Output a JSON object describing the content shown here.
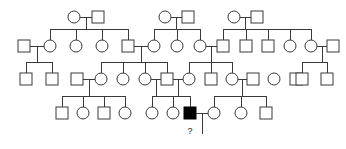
{
  "figure": {
    "background_color": "#ffffff",
    "line_color": "#3a3a3a",
    "unaffected_fill": "#ffffff",
    "affected_fill": "#000000",
    "symbol_size": 12,
    "generations": 4
  },
  "legend": {
    "square_meaning": "male",
    "circle_meaning": "female",
    "filled_meaning": "affected individual",
    "question_mark_meaning": "status unknown"
  },
  "annotations": [
    {
      "id": "unknown-status-marker",
      "text": "?",
      "x": 190,
      "y": 134
    }
  ],
  "chart_data": {
    "type": "diagram",
    "individuals": [
      {
        "id": "I-1",
        "sex": "female",
        "shape": "circle",
        "affected": false,
        "generation": 1,
        "cx": 74,
        "cy": 17
      },
      {
        "id": "I-2",
        "sex": "male",
        "shape": "square",
        "affected": false,
        "generation": 1,
        "cx": 98,
        "cy": 17
      },
      {
        "id": "I-3",
        "sex": "female",
        "shape": "circle",
        "affected": false,
        "generation": 1,
        "cx": 165,
        "cy": 17
      },
      {
        "id": "I-4",
        "sex": "male",
        "shape": "square",
        "affected": false,
        "generation": 1,
        "cx": 188,
        "cy": 17
      },
      {
        "id": "I-5",
        "sex": "female",
        "shape": "circle",
        "affected": false,
        "generation": 1,
        "cx": 234,
        "cy": 17
      },
      {
        "id": "I-6",
        "sex": "male",
        "shape": "square",
        "affected": false,
        "generation": 1,
        "cx": 257,
        "cy": 17
      },
      {
        "id": "II-1",
        "sex": "male",
        "shape": "square",
        "affected": false,
        "generation": 2,
        "cx": 24,
        "cy": 46
      },
      {
        "id": "II-2",
        "sex": "female",
        "shape": "circle",
        "affected": false,
        "generation": 2,
        "cx": 50,
        "cy": 46
      },
      {
        "id": "II-3",
        "sex": "female",
        "shape": "circle",
        "affected": false,
        "generation": 2,
        "cx": 76,
        "cy": 46
      },
      {
        "id": "II-4",
        "sex": "female",
        "shape": "circle",
        "affected": false,
        "generation": 2,
        "cx": 102,
        "cy": 46
      },
      {
        "id": "II-5",
        "sex": "male",
        "shape": "square",
        "affected": false,
        "generation": 2,
        "cx": 128,
        "cy": 46
      },
      {
        "id": "II-6",
        "sex": "female",
        "shape": "circle",
        "affected": false,
        "generation": 2,
        "cx": 154,
        "cy": 46
      },
      {
        "id": "II-7",
        "sex": "female",
        "shape": "circle",
        "affected": false,
        "generation": 2,
        "cx": 177,
        "cy": 46
      },
      {
        "id": "II-8",
        "sex": "female",
        "shape": "circle",
        "affected": false,
        "generation": 2,
        "cx": 200,
        "cy": 46
      },
      {
        "id": "II-9",
        "sex": "male",
        "shape": "square",
        "affected": false,
        "generation": 2,
        "cx": 223,
        "cy": 46
      },
      {
        "id": "II-10",
        "sex": "male",
        "shape": "square",
        "affected": false,
        "generation": 2,
        "cx": 246,
        "cy": 46
      },
      {
        "id": "II-11",
        "sex": "male",
        "shape": "square",
        "affected": false,
        "generation": 2,
        "cx": 268,
        "cy": 46
      },
      {
        "id": "II-12",
        "sex": "female",
        "shape": "circle",
        "affected": false,
        "generation": 2,
        "cx": 290,
        "cy": 46
      },
      {
        "id": "II-13",
        "sex": "female",
        "shape": "circle",
        "affected": false,
        "generation": 2,
        "cx": 311,
        "cy": 46
      },
      {
        "id": "II-14",
        "sex": "male",
        "shape": "square",
        "affected": false,
        "generation": 2,
        "cx": 333,
        "cy": 46
      },
      {
        "id": "III-1",
        "sex": "male",
        "shape": "square",
        "affected": false,
        "generation": 3,
        "cx": 26,
        "cy": 79
      },
      {
        "id": "III-2",
        "sex": "male",
        "shape": "square",
        "affected": false,
        "generation": 3,
        "cx": 52,
        "cy": 79
      },
      {
        "id": "III-3",
        "sex": "male",
        "shape": "square",
        "affected": false,
        "generation": 3,
        "cx": 77,
        "cy": 79
      },
      {
        "id": "III-4",
        "sex": "female",
        "shape": "circle",
        "affected": false,
        "generation": 3,
        "cx": 101,
        "cy": 79
      },
      {
        "id": "III-5",
        "sex": "female",
        "shape": "circle",
        "affected": false,
        "generation": 3,
        "cx": 123,
        "cy": 79
      },
      {
        "id": "III-6",
        "sex": "female",
        "shape": "circle",
        "affected": false,
        "generation": 3,
        "cx": 145,
        "cy": 79
      },
      {
        "id": "III-7",
        "sex": "male",
        "shape": "square",
        "affected": false,
        "generation": 3,
        "cx": 167,
        "cy": 79
      },
      {
        "id": "III-8",
        "sex": "female",
        "shape": "circle",
        "affected": false,
        "generation": 3,
        "cx": 189,
        "cy": 79
      },
      {
        "id": "III-9",
        "sex": "male",
        "shape": "square",
        "affected": false,
        "generation": 3,
        "cx": 211,
        "cy": 79
      },
      {
        "id": "III-10",
        "sex": "female",
        "shape": "circle",
        "affected": false,
        "generation": 3,
        "cx": 232,
        "cy": 79
      },
      {
        "id": "III-11",
        "sex": "male",
        "shape": "square",
        "affected": false,
        "generation": 3,
        "cx": 253,
        "cy": 79
      },
      {
        "id": "III-12",
        "sex": "female",
        "shape": "circle",
        "affected": false,
        "generation": 3,
        "cx": 274,
        "cy": 79
      },
      {
        "id": "III-13",
        "sex": "male",
        "shape": "square",
        "affected": false,
        "generation": 3,
        "cx": 296,
        "cy": 79
      },
      {
        "id": "III-14",
        "sex": "male",
        "shape": "square",
        "affected": false,
        "generation": 3,
        "cx": 302,
        "cy": 79
      },
      {
        "id": "III-15",
        "sex": "male",
        "shape": "square",
        "affected": false,
        "generation": 3,
        "cx": 327,
        "cy": 79
      },
      {
        "id": "IV-1",
        "sex": "male",
        "shape": "square",
        "affected": false,
        "generation": 4,
        "cx": 62,
        "cy": 113
      },
      {
        "id": "IV-2",
        "sex": "female",
        "shape": "circle",
        "affected": false,
        "generation": 4,
        "cx": 83,
        "cy": 113
      },
      {
        "id": "IV-3",
        "sex": "male",
        "shape": "square",
        "affected": false,
        "generation": 4,
        "cx": 104,
        "cy": 113
      },
      {
        "id": "IV-4",
        "sex": "female",
        "shape": "circle",
        "affected": false,
        "generation": 4,
        "cx": 125,
        "cy": 113
      },
      {
        "id": "IV-5",
        "sex": "female",
        "shape": "circle",
        "affected": false,
        "generation": 4,
        "cx": 152,
        "cy": 113
      },
      {
        "id": "IV-6",
        "sex": "female",
        "shape": "circle",
        "affected": false,
        "generation": 4,
        "cx": 173,
        "cy": 113
      },
      {
        "id": "IV-7",
        "sex": "male",
        "shape": "square",
        "affected": true,
        "generation": 4,
        "cx": 190,
        "cy": 113
      },
      {
        "id": "IV-8",
        "sex": "female",
        "shape": "circle",
        "affected": false,
        "generation": 4,
        "cx": 214,
        "cy": 113
      },
      {
        "id": "IV-9",
        "sex": "female",
        "shape": "circle",
        "affected": false,
        "generation": 4,
        "cx": 241,
        "cy": 113
      },
      {
        "id": "IV-10",
        "sex": "male",
        "shape": "square",
        "affected": false,
        "generation": 4,
        "cx": 266,
        "cy": 113
      }
    ],
    "mating_lines": [
      {
        "x1": 80,
        "x2": 92,
        "y": 17
      },
      {
        "x1": 171,
        "x2": 182,
        "y": 17
      },
      {
        "x1": 240,
        "x2": 251,
        "y": 17
      },
      {
        "x1": 30,
        "x2": 44,
        "y": 46
      },
      {
        "x1": 134,
        "x2": 148,
        "y": 46
      },
      {
        "x1": 206,
        "x2": 217,
        "y": 46
      },
      {
        "x1": 317,
        "x2": 327,
        "y": 46
      },
      {
        "x1": 83,
        "x2": 95,
        "y": 79
      },
      {
        "x1": 151,
        "x2": 161,
        "y": 79
      },
      {
        "x1": 173,
        "x2": 183,
        "y": 79
      },
      {
        "x1": 238,
        "x2": 247,
        "y": 79
      },
      {
        "x1": 196,
        "x2": 208,
        "y": 113
      }
    ],
    "descent_drops": [
      {
        "x": 86,
        "y1": 17,
        "y2": 29
      },
      {
        "x": 176,
        "y1": 17,
        "y2": 29
      },
      {
        "x": 245,
        "y1": 17,
        "y2": 29
      },
      {
        "x": 37,
        "y1": 46,
        "y2": 62
      },
      {
        "x": 141,
        "y1": 46,
        "y2": 62
      },
      {
        "x": 211,
        "y1": 46,
        "y2": 62
      },
      {
        "x": 322,
        "y1": 46,
        "y2": 62
      },
      {
        "x": 89,
        "y1": 79,
        "y2": 96
      },
      {
        "x": 156,
        "y1": 79,
        "y2": 96
      },
      {
        "x": 178,
        "y1": 79,
        "y2": 96
      },
      {
        "x": 242,
        "y1": 79,
        "y2": 96
      },
      {
        "x": 202,
        "y1": 113,
        "y2": 134
      }
    ],
    "sibship_bars": [
      {
        "y": 29,
        "x1": 50,
        "x2": 128,
        "children_x": [
          50,
          76,
          102,
          128
        ]
      },
      {
        "y": 29,
        "x1": 154,
        "x2": 200,
        "children_x": [
          154,
          177,
          200
        ]
      },
      {
        "y": 29,
        "x1": 223,
        "x2": 311,
        "children_x": [
          223,
          246,
          268,
          290,
          311
        ]
      },
      {
        "y": 62,
        "x1": 26,
        "x2": 52,
        "children_x": [
          26,
          52
        ]
      },
      {
        "y": 62,
        "x1": 101,
        "x2": 167,
        "children_x": [
          101,
          123,
          145,
          167
        ]
      },
      {
        "y": 62,
        "x1": 189,
        "x2": 232,
        "children_x": [
          189,
          211,
          232
        ]
      },
      {
        "y": 62,
        "x1": 302,
        "x2": 327,
        "children_x": [
          302,
          327
        ]
      },
      {
        "y": 96,
        "x1": 62,
        "x2": 125,
        "children_x": [
          62,
          83,
          104,
          125
        ]
      },
      {
        "y": 96,
        "x1": 152,
        "x2": 190,
        "children_x": [
          152,
          173,
          190
        ]
      },
      {
        "y": 96,
        "x1": 214,
        "x2": 266,
        "children_x": [
          214,
          241,
          266
        ]
      }
    ],
    "counts": {
      "total_individuals": 49,
      "affected_individuals": 1,
      "unknown_status": 1,
      "generations": 4
    }
  }
}
